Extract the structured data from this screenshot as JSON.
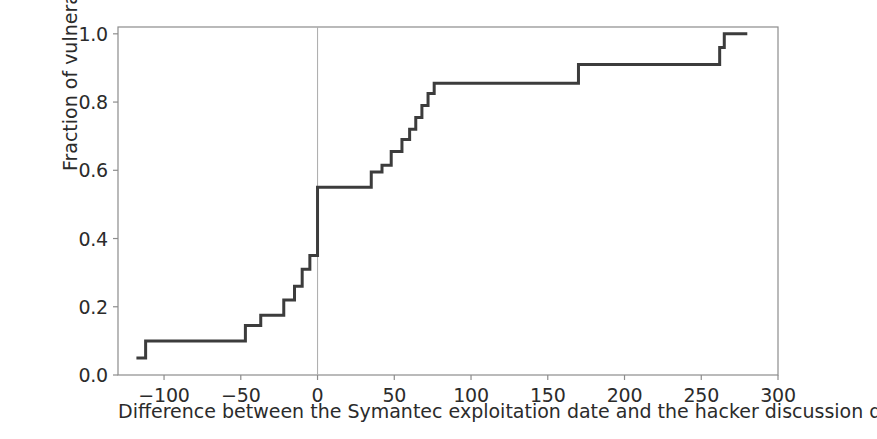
{
  "chart_data": {
    "type": "line",
    "step": "post",
    "title": "",
    "subtitle": "",
    "xlabel": "Difference between the Symantec exploitation date and the hacker discussion date in days",
    "ylabel": "Fraction of vulnerabilities",
    "xlim": [
      -130,
      300
    ],
    "ylim": [
      0.0,
      1.02
    ],
    "xticks": [
      -100,
      -50,
      0,
      50,
      100,
      150,
      200,
      250,
      300
    ],
    "xtick_labels": [
      "−100",
      "−50",
      "0",
      "50",
      "100",
      "150",
      "200",
      "250",
      "300"
    ],
    "yticks": [
      0.0,
      0.2,
      0.4,
      0.6,
      0.8,
      1.0
    ],
    "ytick_labels": [
      "0.0",
      "0.2",
      "0.4",
      "0.6",
      "0.8",
      "1.0"
    ],
    "grid": false,
    "legend": null,
    "annotations": [
      {
        "name": "zero-reference-line",
        "type": "vline",
        "x": 0,
        "color": "#b0b0b0"
      }
    ],
    "line_color": "#3c3c3c",
    "line_width": 3,
    "series": [
      {
        "name": "Empirical CDF",
        "x": [
          -118,
          -112,
          -47,
          -37,
          -22,
          -15,
          -10,
          -5,
          0,
          35,
          42,
          48,
          55,
          60,
          64,
          68,
          72,
          76,
          170,
          262,
          265,
          280
        ],
        "y": [
          0.05,
          0.1,
          0.145,
          0.175,
          0.22,
          0.26,
          0.31,
          0.35,
          0.55,
          0.595,
          0.615,
          0.655,
          0.69,
          0.72,
          0.755,
          0.79,
          0.825,
          0.855,
          0.91,
          0.96,
          1.0,
          1.0
        ]
      }
    ]
  },
  "axes": {
    "frame_color": "#8c8c8c",
    "background": "#ffffff"
  }
}
